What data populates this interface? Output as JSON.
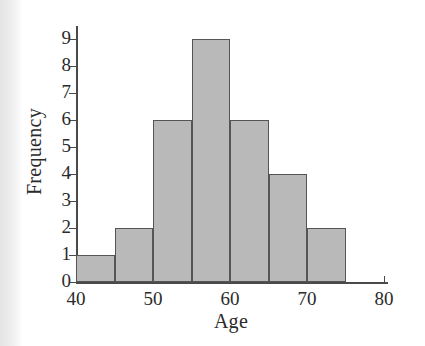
{
  "chart_data": {
    "type": "bar",
    "subtype": "histogram",
    "title": "",
    "xlabel": "Age",
    "ylabel": "Frequency",
    "bin_width": 5,
    "bin_edges": [
      40,
      45,
      50,
      55,
      60,
      65,
      70,
      75
    ],
    "categories": [
      "40-45",
      "45-50",
      "50-55",
      "55-60",
      "60-65",
      "65-70",
      "70-75"
    ],
    "values": [
      1,
      2,
      6,
      9,
      6,
      4,
      2
    ],
    "bars": [
      {
        "start": 40,
        "end": 45,
        "value": 1
      },
      {
        "start": 45,
        "end": 50,
        "value": 2
      },
      {
        "start": 50,
        "end": 55,
        "value": 6
      },
      {
        "start": 55,
        "end": 60,
        "value": 9
      },
      {
        "start": 60,
        "end": 65,
        "value": 6
      },
      {
        "start": 65,
        "end": 70,
        "value": 4
      },
      {
        "start": 70,
        "end": 75,
        "value": 2
      }
    ],
    "xlim": [
      40,
      80
    ],
    "ylim": [
      0,
      9
    ],
    "x_ticks": [
      40,
      50,
      60,
      70,
      80
    ],
    "x_tick_labels": [
      "40",
      "50",
      "60",
      "70",
      "80"
    ],
    "y_ticks": [
      0,
      1,
      2,
      3,
      4,
      5,
      6,
      7,
      8,
      9
    ],
    "y_tick_labels": [
      "0",
      "1",
      "2",
      "3",
      "4",
      "5",
      "6",
      "7",
      "8",
      "9"
    ],
    "grid": false,
    "legend": null,
    "colors": {
      "bar_fill": "#b9b9b9",
      "bar_edge": "#555555",
      "axis": "#4a4a4a",
      "text": "#2b2b2b",
      "background": "#ffffff"
    }
  }
}
